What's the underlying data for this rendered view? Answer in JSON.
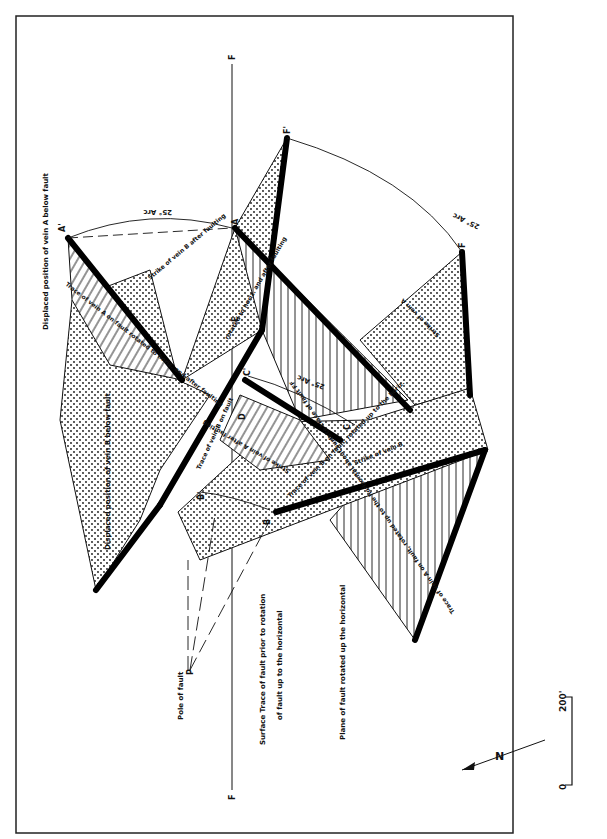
{
  "figure": {
    "frame_color": "#222222",
    "ink_color": "#111111",
    "background": "#ffffff",
    "labels": {
      "displaced_vein_a": "Displaced position of vein A below fault",
      "displaced_vein_b": "Displaced position of vein B below fault",
      "pole_of_fault": "Pole of fault",
      "surface_trace_1": "Surface Trace of fault prior to rotation",
      "surface_trace_2": "of fault up to the horizontal",
      "plane_rotated": "Plane of fault rotated up the horizontal",
      "trace_a_rotated": "Trace of vein A on fault rotated to horiz. and after faulting",
      "strike_b_after": "Strike of vein B after faulting",
      "rotated_horiz_after": "rotated to horiz. and after faulting",
      "trace_b_on_fault": "Trace of vein B on fault",
      "strike_a_after": "Strike of vein A after faulting",
      "trace_b_rotated": "Trace of vein B on fault, rotated up to the horiz.",
      "strike_b": "Strike of vein B",
      "trace_a_horiz": "Trace of vein A on fault, rotated up to the horizontal about surface trace of fault FF",
      "strike_a": "Strike of vein A",
      "arc_1": "25° Arc",
      "arc_2": "25° Arc",
      "arc_3": "25° Arc"
    },
    "points": {
      "A": "A",
      "A_prime": "A'",
      "B": "B",
      "B_prime": "B'",
      "C": "C",
      "C_prime": "C'",
      "D": "D",
      "E": "E",
      "F_top": "F",
      "F_bottom": "F",
      "F_right": "F",
      "F_prime": "F'",
      "P": "P"
    },
    "north_arrow": "N",
    "scale": {
      "start": "0",
      "end": "200'"
    }
  }
}
